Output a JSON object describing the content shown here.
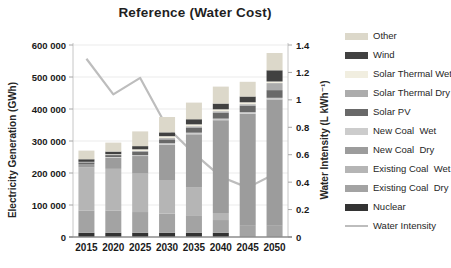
{
  "chart_data": {
    "type": "bar",
    "subtype": "stacked-bar-with-line",
    "title": "Reference (Water Cost)",
    "categories": [
      "2015",
      "2020",
      "2025",
      "2030",
      "2035",
      "2040",
      "2045",
      "2050"
    ],
    "left_axis": {
      "label": "Electricity Generation (GWh)",
      "min": 0,
      "max": 600000,
      "tick_step": 100000,
      "tick_labels": [
        "0",
        "100 000",
        "200 000",
        "300 000",
        "400 000",
        "500 000",
        "600 000"
      ]
    },
    "right_axis": {
      "label": "Water Intensity (L kWh⁻¹)",
      "min": 0,
      "max": 1.4,
      "tick_step": 0.2,
      "tick_labels": [
        "0",
        "0.2",
        "0.4",
        "0.6",
        "0.8",
        "1",
        "1.2",
        "1.4"
      ]
    },
    "grid": true,
    "legend_position": "right",
    "series": [
      {
        "name": "Nuclear",
        "color": "#333333",
        "values": [
          13000,
          13000,
          13000,
          13000,
          13000,
          13000,
          0,
          0
        ]
      },
      {
        "name": "Existing Coal  Dry",
        "color": "#a3a3a3",
        "values": [
          70000,
          70000,
          65000,
          60000,
          55000,
          40000,
          35000,
          35000
        ]
      },
      {
        "name": "Existing Coal  Wet",
        "color": "#b5b5b5",
        "values": [
          135000,
          130000,
          120000,
          105000,
          88000,
          22000,
          0,
          0
        ]
      },
      {
        "name": "New Coal  Dry",
        "color": "#9c9c9c",
        "values": [
          10000,
          35000,
          55000,
          110000,
          165000,
          290000,
          350000,
          395000
        ]
      },
      {
        "name": "New Coal  Wet",
        "color": "#cccccc",
        "values": [
          0,
          2000,
          3000,
          5000,
          5000,
          5000,
          5000,
          5000
        ]
      },
      {
        "name": "Solar PV",
        "color": "#696969",
        "values": [
          5000,
          6000,
          10000,
          12000,
          16000,
          18000,
          20000,
          24000
        ]
      },
      {
        "name": "Solar Thermal Dry",
        "color": "#acacac",
        "values": [
          2000,
          2000,
          3000,
          4000,
          4000,
          5000,
          5000,
          22000
        ]
      },
      {
        "name": "Solar Thermal Wet",
        "color": "#f1eee0",
        "values": [
          0,
          1000,
          5000,
          6000,
          6000,
          6000,
          6000,
          5000
        ]
      },
      {
        "name": "Wind",
        "color": "#414141",
        "values": [
          8000,
          8000,
          10000,
          12000,
          16000,
          18000,
          18000,
          35000
        ]
      },
      {
        "name": "Other",
        "color": "#dcd8ca",
        "values": [
          27000,
          28000,
          46000,
          48000,
          52000,
          53000,
          46000,
          54000
        ]
      }
    ],
    "bar_totals": [
      270000,
      295000,
      330000,
      375000,
      420000,
      470000,
      485000,
      575000
    ],
    "line_series": {
      "name": "Water Intensity",
      "color": "#bdbdbd",
      "values": [
        1.3,
        1.04,
        1.16,
        0.8,
        0.61,
        0.44,
        0.36,
        0.46
      ]
    },
    "legend": {
      "order": [
        "Other",
        "Wind",
        "Solar Thermal Wet",
        "Solar Thermal Dry",
        "Solar PV",
        "New Coal  Wet",
        "New Coal  Dry",
        "Existing Coal  Wet",
        "Existing Coal  Dry",
        "Nuclear",
        "Water Intensity"
      ]
    }
  }
}
